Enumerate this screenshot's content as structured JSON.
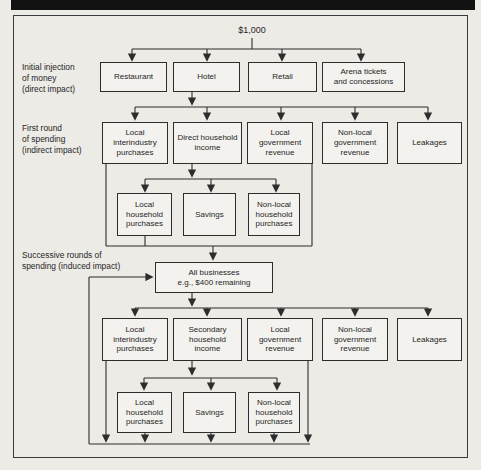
{
  "figure": {
    "amount_label": "$1,000",
    "stage_labels": [
      "Initial injection\nof money\n(direct impact)",
      "First round\nof spending\n(indirect impact)",
      "Successive rounds of\nspending (induced impact)"
    ],
    "direct_row": [
      "Restaurant",
      "Hotel",
      "Retail",
      "Arena tickets\nand concessions"
    ],
    "first_round_row": [
      "Local\ninterindustry\npurchases",
      "Direct household\nincome",
      "Local\ngovernment\nrevenue",
      "Non-local\ngovernment\nrevenue",
      "Leakages"
    ],
    "first_household_row": [
      "Local\nhousehold\npurchases",
      "Savings",
      "Non-local\nhousehold\npurchases"
    ],
    "all_businesses": "All businesses\ne.g., $400 remaining",
    "second_round_row": [
      "Local\ninterindustry\npurchases",
      "Secondary\nhousehold\nincome",
      "Local\ngovernment\nrevenue",
      "Non-local\ngovernment\nrevenue",
      "Leakages"
    ],
    "second_household_row": [
      "Local\nhousehold\npurchases",
      "Savings",
      "Non-local\nhousehold\npurchases"
    ],
    "colors": {
      "line": "#2d2d2d",
      "paper": "#edebe6",
      "box_fill": "#f3f2ee",
      "header_bar": "#121212"
    }
  }
}
